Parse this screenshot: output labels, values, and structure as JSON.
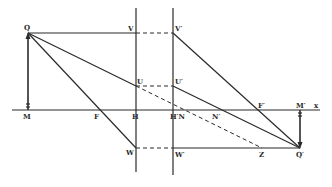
{
  "figure": {
    "type": "optics ray diagram (thick lens / two principal planes)",
    "colors": {
      "ink": "#2a2a2a",
      "background": "#ffffff"
    }
  },
  "labels": {
    "Q": "Q",
    "V": "V",
    "V_prime": "V′",
    "U": "U",
    "U_prime": "U′",
    "M": "M",
    "F": "F",
    "H": "H",
    "H_prime_N": "H′N",
    "N_prime": "N′",
    "F_prime": "F′",
    "M_prime": "M′",
    "x": "x",
    "W": "W",
    "W_prime": "W′",
    "Z": "Z",
    "Q_prime": "Q′"
  },
  "points": {
    "Q": [
      28,
      33
    ],
    "M": [
      28,
      110
    ],
    "F": [
      101,
      110
    ],
    "H": [
      136,
      110
    ],
    "V": [
      136,
      33
    ],
    "U": [
      136,
      86
    ],
    "W": [
      136,
      148
    ],
    "H_prime": [
      173,
      110
    ],
    "V_prime": [
      173,
      33
    ],
    "U_prime": [
      173,
      86
    ],
    "W_prime": [
      173,
      148
    ],
    "N_prime": [
      218,
      110
    ],
    "F_prime": [
      259,
      110
    ],
    "M_prime": [
      300,
      110
    ],
    "Z": [
      262,
      148
    ],
    "Q_prime": [
      300,
      148
    ]
  }
}
